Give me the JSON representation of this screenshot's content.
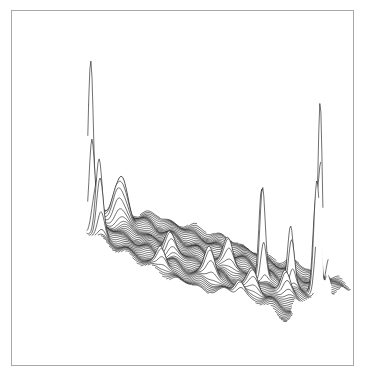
{
  "chart_data": {
    "type": "surface-ridgeline",
    "title": "",
    "subtitle": "",
    "xlabel": "",
    "ylabel": "",
    "grid": false,
    "legend": null,
    "line_color": "#111111",
    "frame_color": "#a8a8a8",
    "background": "#ffffff",
    "num_profiles": 70,
    "outline": [
      [
        0.0,
        0.52
      ],
      [
        0.06,
        0.4
      ],
      [
        0.12,
        0.3
      ],
      [
        0.2,
        0.22
      ],
      [
        0.32,
        0.18
      ],
      [
        0.48,
        0.2
      ],
      [
        0.62,
        0.26
      ],
      [
        0.74,
        0.34
      ],
      [
        0.86,
        0.38
      ],
      [
        0.97,
        0.42
      ],
      [
        1.0,
        0.47
      ],
      [
        0.93,
        0.55
      ],
      [
        0.85,
        0.62
      ],
      [
        0.77,
        0.7
      ],
      [
        0.7,
        0.78
      ],
      [
        0.66,
        0.86
      ],
      [
        0.64,
        0.95
      ],
      [
        0.6,
        0.99
      ],
      [
        0.57,
        0.9
      ],
      [
        0.52,
        0.84
      ],
      [
        0.42,
        0.84
      ],
      [
        0.32,
        0.86
      ],
      [
        0.22,
        0.83
      ],
      [
        0.15,
        0.74
      ],
      [
        0.08,
        0.66
      ]
    ],
    "peaks": [
      {
        "label": "Seattle/West spike",
        "u": 0.03,
        "v": 0.48,
        "height": 0.95,
        "width": 0.01
      },
      {
        "label": "Secondary west spike",
        "u": 0.05,
        "v": 0.52,
        "height": 0.4,
        "width": 0.012
      },
      {
        "label": "Northwest ridge",
        "u": 0.2,
        "v": 0.3,
        "height": 0.22,
        "width": 0.02
      },
      {
        "label": "Northwest ridge 2",
        "u": 0.17,
        "v": 0.33,
        "height": 0.15,
        "width": 0.018
      },
      {
        "label": "Central bump",
        "u": 0.3,
        "v": 0.55,
        "height": 0.12,
        "width": 0.018
      },
      {
        "label": "Mid spike",
        "u": 0.52,
        "v": 0.55,
        "height": 0.15,
        "width": 0.016
      },
      {
        "label": "Chicago-like spike",
        "u": 0.63,
        "v": 0.6,
        "height": 0.55,
        "width": 0.01
      },
      {
        "label": "East spike A",
        "u": 0.73,
        "v": 0.62,
        "height": 0.32,
        "width": 0.011
      },
      {
        "label": "Tall east spike (NYC)",
        "u": 0.84,
        "v": 0.62,
        "height": 1.0,
        "width": 0.008
      },
      {
        "label": "East spike B",
        "u": 0.82,
        "v": 0.64,
        "height": 0.62,
        "width": 0.011
      },
      {
        "label": "East spike C",
        "u": 0.88,
        "v": 0.6,
        "height": 0.22,
        "width": 0.012
      },
      {
        "label": "South bump 1",
        "u": 0.4,
        "v": 0.72,
        "height": 0.18,
        "width": 0.018
      },
      {
        "label": "South bump 2",
        "u": 0.55,
        "v": 0.76,
        "height": 0.12,
        "width": 0.018
      },
      {
        "label": "South bump 3",
        "u": 0.68,
        "v": 0.72,
        "height": 0.14,
        "width": 0.016
      },
      {
        "label": "Southwest bump",
        "u": 0.22,
        "v": 0.72,
        "height": 0.12,
        "width": 0.016
      },
      {
        "label": "Gulf bump",
        "u": 0.48,
        "v": 0.82,
        "height": 0.08,
        "width": 0.016
      }
    ],
    "projection": {
      "origin_px": [
        60,
        200
      ],
      "u_vector_px": [
        270,
        60
      ],
      "v_vector_px": [
        0,
        0
      ],
      "depth_vector_px": [
        80,
        110
      ],
      "height_scale_px": 185
    }
  }
}
